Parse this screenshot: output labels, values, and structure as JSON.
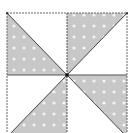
{
  "diagram": {
    "type": "pinwheel-quilt-block",
    "grid": "2x2",
    "colors": {
      "background": "#ffffff",
      "shaded_fill": "#c8c8c8",
      "dot": "#f4f4f4",
      "line": "#444444",
      "border": "#666666"
    },
    "quadrants": [
      {
        "position": "top-left",
        "shaded_half": "lower-left"
      },
      {
        "position": "top-right",
        "shaded_half": "upper-left"
      },
      {
        "position": "bottom-right",
        "shaded_half": "upper-right"
      },
      {
        "position": "bottom-left",
        "shaded_half": "lower-right"
      }
    ]
  }
}
